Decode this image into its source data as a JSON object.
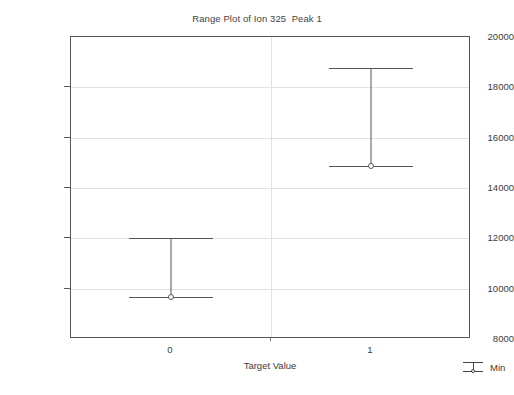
{
  "chart_data": {
    "type": "bar",
    "title": "Range Plot of Ion 325  Peak 1",
    "xlabel": "Target Value",
    "ylabel": "Ion count",
    "categories": [
      "0",
      "1"
    ],
    "ylim": [
      8000,
      20000
    ],
    "ytick_values": [
      20000,
      18000,
      16000,
      14000,
      12000,
      10000,
      8000
    ],
    "ytick_labels": [
      "20000",
      "18000",
      "16000",
      "14000",
      "12000",
      "10000",
      "8000"
    ],
    "grid": true,
    "legend_position": "outside-bottom-right",
    "legend": [
      {
        "label": "Min",
        "symbol": "range-min-marker"
      }
    ],
    "series": [
      {
        "name": "Range",
        "max_values": [
          12000,
          18770
        ],
        "min_values": [
          9660,
          14880
        ]
      }
    ],
    "points": [
      {
        "category": "0",
        "max": 12000,
        "min": 9660
      },
      {
        "category": "1",
        "max": 18770,
        "min": 14880
      }
    ],
    "colors": {
      "line": "#555555",
      "grid": "#e2e2e2",
      "frame": "#555555",
      "text": "#3b3b3b",
      "background": "#ffffff"
    }
  }
}
